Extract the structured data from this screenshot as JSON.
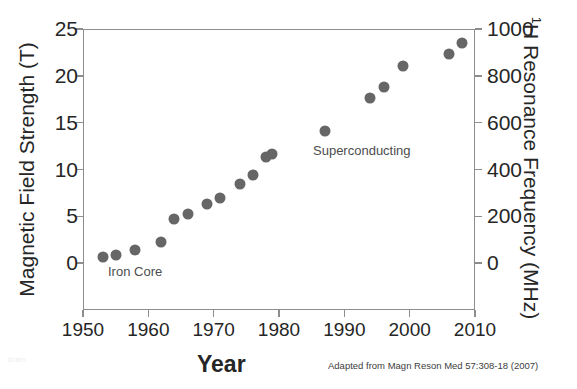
{
  "chart_data": {
    "type": "scatter",
    "title": "",
    "xlabel": "Year",
    "ylabel": "Magnetic Field Strength (T)",
    "ylabel_right": "¹H Resonance Frequency (MHz)",
    "xlim": [
      1950,
      2010
    ],
    "ylim": [
      -5,
      25
    ],
    "ylim_right": [
      -200,
      1000
    ],
    "grid": false,
    "legend": "none",
    "x_ticks": [
      1950,
      1960,
      1970,
      1980,
      1990,
      2000,
      2010
    ],
    "x_tick_labels": [
      "1950",
      "1960",
      "1970",
      "1980",
      "1990",
      "2000",
      "2010"
    ],
    "y_ticks_left": [
      0,
      5,
      10,
      15,
      20,
      25
    ],
    "y_tick_labels_left": [
      "0",
      "5",
      "10",
      "15",
      "20",
      "25"
    ],
    "y_ticks_right": [
      0,
      200,
      400,
      600,
      800,
      1000
    ],
    "y_tick_labels_right": [
      "0",
      "200",
      "400",
      "600",
      "800",
      "1000"
    ],
    "marker_color": "#666666",
    "axis_color": "#8d8d8d",
    "text_color": "#262626",
    "series": [
      {
        "name": "NMR magnet field strength",
        "points": [
          {
            "x": 1953,
            "y": 0.7
          },
          {
            "x": 1955,
            "y": 0.9
          },
          {
            "x": 1958,
            "y": 1.4
          },
          {
            "x": 1962,
            "y": 2.3
          },
          {
            "x": 1964,
            "y": 4.7
          },
          {
            "x": 1966,
            "y": 5.2
          },
          {
            "x": 1969,
            "y": 6.3
          },
          {
            "x": 1971,
            "y": 7.0
          },
          {
            "x": 1974,
            "y": 8.5
          },
          {
            "x": 1976,
            "y": 9.4
          },
          {
            "x": 1978,
            "y": 11.3
          },
          {
            "x": 1979,
            "y": 11.7
          },
          {
            "x": 1987,
            "y": 14.1
          },
          {
            "x": 1994,
            "y": 17.6
          },
          {
            "x": 1996,
            "y": 18.8
          },
          {
            "x": 1999,
            "y": 21.1
          },
          {
            "x": 2006,
            "y": 22.3
          },
          {
            "x": 2008,
            "y": 23.5
          }
        ]
      }
    ],
    "annotations": [
      {
        "id": "iron-core",
        "text": "Iron Core",
        "x": 1957,
        "y": -1.0
      },
      {
        "id": "superconducting",
        "text": "Superconducting",
        "x": 1987,
        "y": 11.0
      }
    ],
    "attribution": "Adapted from Magn Reson Med 57:308-18 (2007)",
    "watermark": "brain"
  }
}
